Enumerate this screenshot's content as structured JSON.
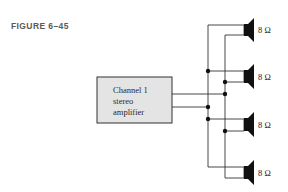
{
  "figure": {
    "label": "FIGURE 6–45"
  },
  "amplifier": {
    "line1": "Channel 1",
    "line2": "stereo",
    "line3": "amplifier",
    "fill_color": "#e4e4e4"
  },
  "speakers": [
    {
      "impedance": "8 Ω"
    },
    {
      "impedance": "8 Ω"
    },
    {
      "impedance": "8 Ω"
    },
    {
      "impedance": "8 Ω"
    }
  ],
  "colors": {
    "wire": "#333333",
    "speaker": "#111111"
  }
}
